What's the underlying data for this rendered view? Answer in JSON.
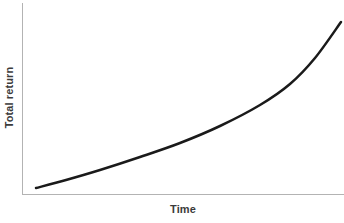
{
  "figure": {
    "background_color": "#ffffff",
    "width": 344,
    "height": 223
  },
  "chart_data": {
    "type": "line",
    "title": "",
    "subtitle": "",
    "xlabel": "Time",
    "ylabel": "Total return",
    "annotations": [],
    "legend": {
      "visible": false,
      "position": "none",
      "entries": []
    },
    "grid": false,
    "axes": {
      "x": {
        "label": "Time",
        "tick_labels": [],
        "ticks_visible": false,
        "line_color": "#b3b3b3",
        "range_description": "unlabeled, increasing left to right"
      },
      "y": {
        "label": "Total return",
        "tick_labels": [],
        "ticks_visible": false,
        "line_color": "#b3b3b3",
        "range_description": "unlabeled, increasing bottom to top"
      }
    },
    "series": [
      {
        "name": "Total return",
        "color": "#1a1a1a",
        "line_width": 2.5,
        "shape": "exponential growth",
        "x": [
          0.0,
          0.1,
          0.2,
          0.3,
          0.4,
          0.5,
          0.6,
          0.7,
          0.8,
          0.9,
          1.0
        ],
        "y": [
          0.03,
          0.06,
          0.1,
          0.15,
          0.21,
          0.28,
          0.37,
          0.48,
          0.62,
          0.79,
          1.0
        ],
        "path_points_px": [
          [
            36,
            188
          ],
          [
            66,
            180
          ],
          [
            100,
            170
          ],
          [
            140,
            157
          ],
          [
            180,
            143
          ],
          [
            220,
            126
          ],
          [
            260,
            105
          ],
          [
            290,
            84
          ],
          [
            315,
            58
          ],
          [
            341,
            22
          ]
        ]
      }
    ]
  }
}
